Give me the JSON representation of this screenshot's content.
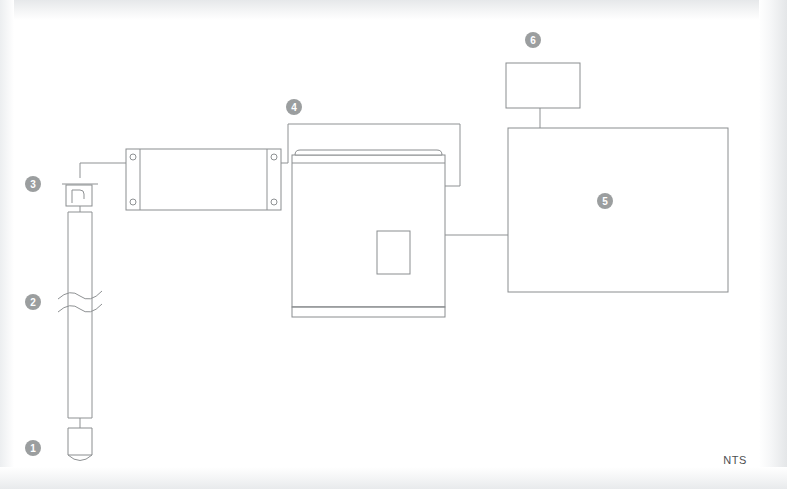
{
  "diagram": {
    "scale_note": "NTS",
    "line_color": "#8e9193",
    "marker_color": "#9b9e9f",
    "marker_text_color": "#ffffff",
    "background_color": "#ffffff",
    "callouts": [
      {
        "id": "callout-1",
        "number": "1",
        "target": "probe-tip",
        "x": 33,
        "y": 448
      },
      {
        "id": "callout-2",
        "number": "2",
        "target": "probe-shaft-break",
        "x": 33,
        "y": 302
      },
      {
        "id": "callout-3",
        "number": "3",
        "target": "cable-head-fitting",
        "x": 33,
        "y": 184
      },
      {
        "id": "callout-4",
        "number": "4",
        "target": "interface-junction-box",
        "x": 294,
        "y": 107
      },
      {
        "id": "callout-5",
        "number": "5",
        "target": "acquisition-unit-large",
        "x": 605,
        "y": 201
      },
      {
        "id": "callout-6",
        "number": "6",
        "target": "display-monitor",
        "x": 533,
        "y": 40
      }
    ],
    "components": [
      {
        "id": "probe-tip",
        "label": "1",
        "shape": "rounded-bottom-cylinder"
      },
      {
        "id": "probe-body",
        "label": "",
        "shape": "long-tube"
      },
      {
        "id": "probe-shaft-break",
        "label": "2",
        "shape": "break-symbol"
      },
      {
        "id": "cable-head-fitting",
        "label": "3",
        "shape": "gland-fitting"
      },
      {
        "id": "interface-junction-box",
        "label": "4",
        "shape": "flanged-rack-box"
      },
      {
        "id": "field-cabinet",
        "label": "",
        "shape": "cabinet-with-panel"
      },
      {
        "id": "acquisition-unit-large",
        "label": "5",
        "shape": "large-rectangle"
      },
      {
        "id": "display-monitor",
        "label": "6",
        "shape": "small-rectangle"
      }
    ]
  }
}
